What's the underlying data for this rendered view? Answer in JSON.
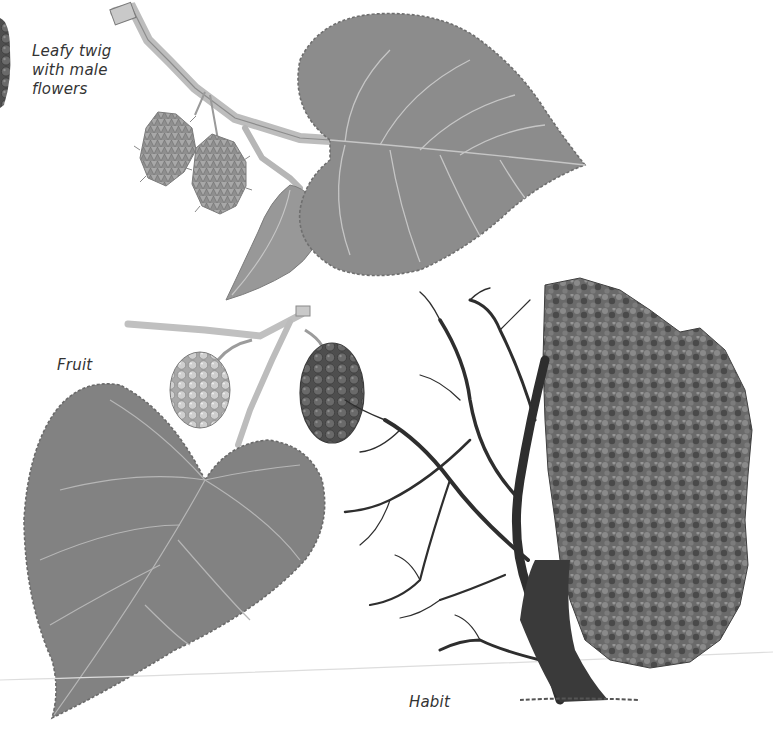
{
  "labels": {
    "leafy_twig": [
      "Leafy twig",
      "with male",
      "flowers"
    ],
    "fruit": "Fruit",
    "habit": "Habit"
  },
  "illustrations": [
    {
      "name": "leafy-twig-with-male-flowers",
      "description": "Twig with serrated heart-shaped leaf and two spiky male catkins"
    },
    {
      "name": "fruit",
      "description": "Twig with large serrated leaf, a pale unripe mulberry and a dark ripe mulberry"
    },
    {
      "name": "habit",
      "description": "Tree shown half bare-branched (left) and half in full foliage (right)"
    },
    {
      "name": "dark-fruit-fragment",
      "description": "Partial dark fruit at left edge"
    }
  ],
  "colors": {
    "background": "#ffffff",
    "leaf": "#8a8a8a",
    "leaf_dark": "#6f6f6f",
    "vein": "#c4c4c4",
    "fruit_dark": "#555555",
    "fruit_light": "#bdbdbd",
    "foliage": "#5e5e5e",
    "branch": "#2e2e2e"
  }
}
